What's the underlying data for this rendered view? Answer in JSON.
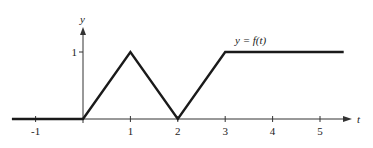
{
  "chart_data": {
    "type": "line",
    "title": "",
    "xlabel": "t",
    "ylabel": "y",
    "function_label": "y = f(t)",
    "xlim": [
      -1.5,
      5.6
    ],
    "ylim": [
      0,
      1.4
    ],
    "grid": false,
    "legend": null,
    "x_ticks": [
      -1,
      1,
      2,
      3,
      4,
      5
    ],
    "x_tick_labels": [
      "-1",
      "1",
      "2",
      "3",
      "4",
      "5"
    ],
    "y_ticks": [
      1
    ],
    "y_tick_labels": [
      "1"
    ],
    "series": [
      {
        "name": "f(t)",
        "x": [
          -1.5,
          0,
          1,
          2,
          3,
          5.5
        ],
        "y": [
          0,
          0,
          1,
          0,
          1,
          1
        ]
      }
    ],
    "colors": {
      "line": "#1a1a1a",
      "axis": "#333333"
    }
  }
}
